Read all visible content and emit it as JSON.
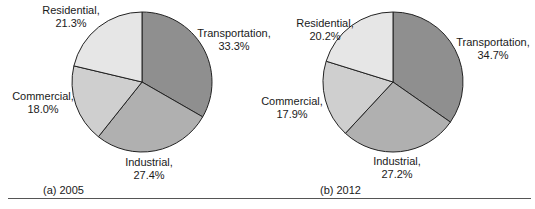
{
  "chart_data": [
    {
      "type": "pie",
      "title": "(a) 2005",
      "categories": [
        "Transportation",
        "Industrial",
        "Commercial",
        "Residential"
      ],
      "values": [
        33.3,
        27.4,
        18.0,
        21.3
      ],
      "labels": [
        "Transportation, 33.3%",
        "Industrial, 27.4%",
        "Commercial, 18.0%",
        "Residential, 21.3%"
      ],
      "start_angle": "12 o'clock, clockwise",
      "colors": [
        "#8f8f8f",
        "#b0b0b0",
        "#cfcfcf",
        "#e6e6e6"
      ]
    },
    {
      "type": "pie",
      "title": "(b) 2012",
      "categories": [
        "Transportation",
        "Industrial",
        "Commercial",
        "Residential"
      ],
      "values": [
        34.7,
        27.2,
        17.9,
        20.2
      ],
      "labels": [
        "Transportation, 34.7%",
        "Industrial, 27.2%",
        "Commercial, 17.9%",
        "Residential, 20.2%"
      ],
      "start_angle": "12 o'clock, clockwise",
      "colors": [
        "#8f8f8f",
        "#b0b0b0",
        "#cfcfcf",
        "#e6e6e6"
      ]
    }
  ],
  "panels": [
    {
      "caption": "(a) 2005",
      "slices": [
        {
          "name": "Transportation,",
          "pct": "33.3%"
        },
        {
          "name": "Industrial,",
          "pct": "27.4%"
        },
        {
          "name": "Commercial,",
          "pct": "18.0%"
        },
        {
          "name": "Residential,",
          "pct": "21.3%"
        }
      ]
    },
    {
      "caption": "(b) 2012",
      "slices": [
        {
          "name": "Transportation,",
          "pct": "34.7%"
        },
        {
          "name": "Industrial,",
          "pct": "27.2%"
        },
        {
          "name": "Commercial,",
          "pct": "17.9%"
        },
        {
          "name": "Residential,",
          "pct": "20.2%"
        }
      ]
    }
  ]
}
